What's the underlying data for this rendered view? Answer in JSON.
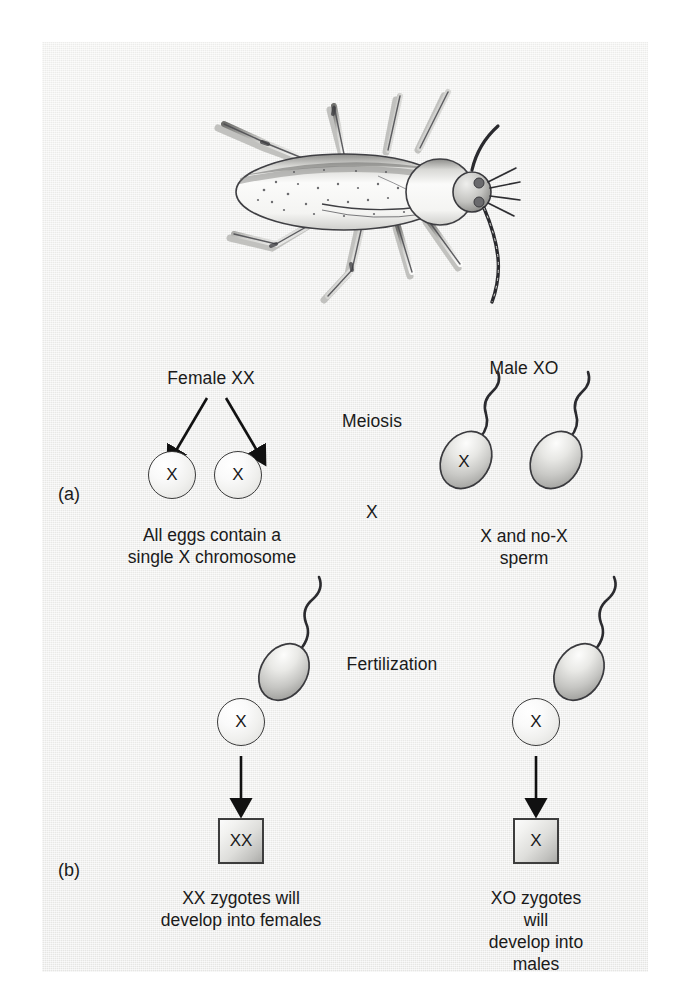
{
  "figure": {
    "background_color": "#eeeeec",
    "ink_color": "#1a1a1a"
  },
  "illustration": {
    "name": "insect-illustration",
    "subject": "bug (Protenor) dorsal view",
    "style": "grayscale ink wash"
  },
  "panels": [
    {
      "letter": "(a)",
      "stage_label": "Meiosis",
      "cross_symbol": "X",
      "female": {
        "label": "Female XX",
        "gametes": [
          {
            "type": "egg",
            "letter": "X"
          },
          {
            "type": "egg",
            "letter": "X"
          }
        ],
        "caption": "All eggs contain a\nsingle X chromosome"
      },
      "male": {
        "label": "Male XO",
        "gametes": [
          {
            "type": "sperm",
            "letter": "X"
          },
          {
            "type": "sperm",
            "letter": ""
          }
        ],
        "caption": "X and no-X sperm"
      }
    },
    {
      "letter": "(b)",
      "stage_label": "Fertilization",
      "crosses": [
        {
          "egg_letter": "X",
          "sperm_letter": "X",
          "zygote_letter": "XX",
          "caption": "XX zygotes will\ndevelop into females"
        },
        {
          "egg_letter": "X",
          "sperm_letter": "",
          "zygote_letter": "X",
          "caption": "XO zygotes will\ndevelop into males"
        }
      ]
    }
  ]
}
